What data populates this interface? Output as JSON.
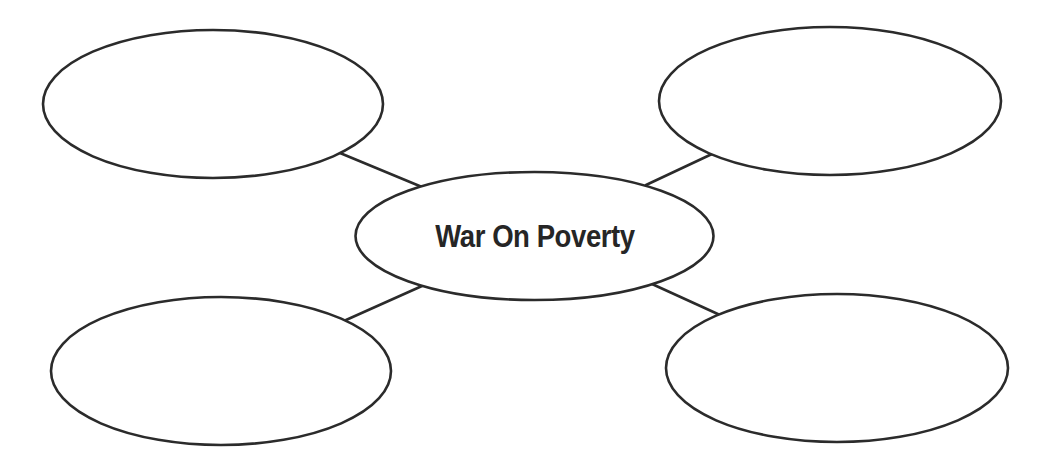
{
  "diagram": {
    "type": "concept-map",
    "center": {
      "label": "War On Poverty"
    },
    "branches": [
      {
        "position": "top-left",
        "label": ""
      },
      {
        "position": "top-right",
        "label": ""
      },
      {
        "position": "bottom-left",
        "label": ""
      },
      {
        "position": "bottom-right",
        "label": ""
      }
    ],
    "colors": {
      "stroke": "#2b2b2b",
      "fill": "#ffffff",
      "text": "#262626"
    }
  }
}
